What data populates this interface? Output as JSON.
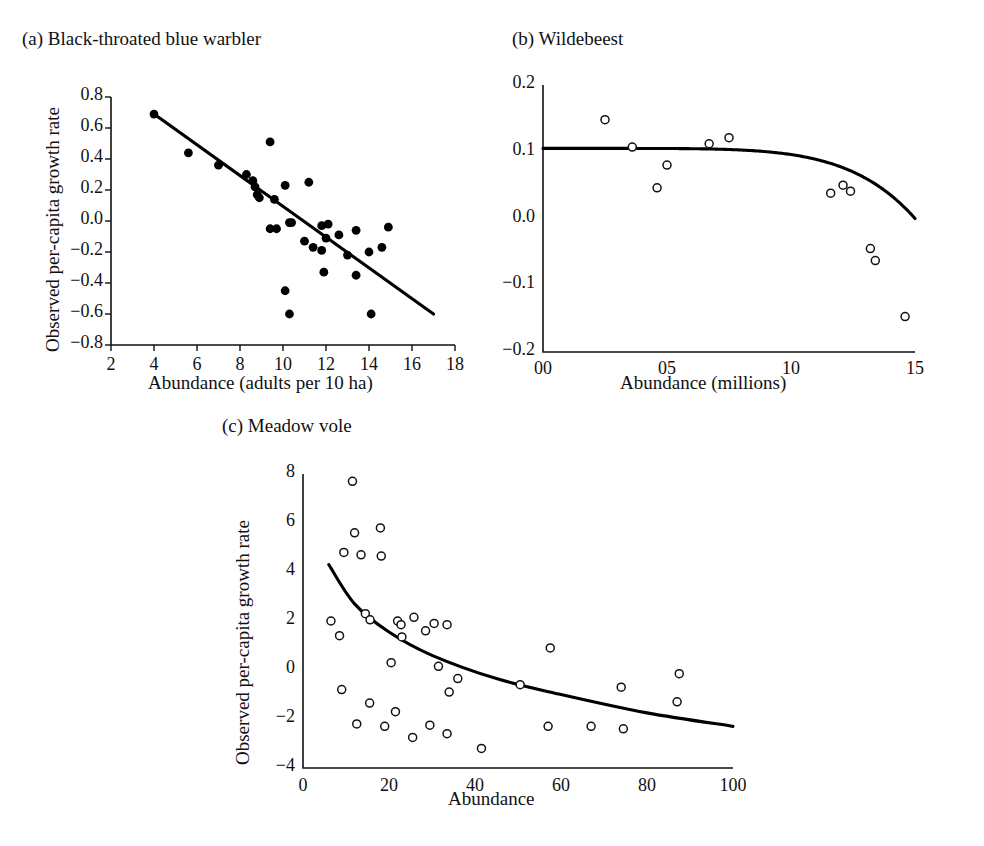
{
  "figure": {
    "background": "#ffffff",
    "ink_color": "#111111"
  },
  "panels": [
    {
      "id": "a",
      "title": "(a) Black-throated blue warbler",
      "marker_style": "filled-circle",
      "fit_type": "linear"
    },
    {
      "id": "b",
      "title": "(b) Wildebeest",
      "marker_style": "open-circle",
      "fit_type": "theta-logistic"
    },
    {
      "id": "c",
      "title": "(c) Meadow vole",
      "marker_style": "open-circle",
      "fit_type": "decaying-curve"
    }
  ],
  "chart_data": [
    {
      "type": "scatter",
      "panel": "a",
      "title": "(a) Black-throated blue warbler",
      "xlabel": "Abundance (adults per 10 ha)",
      "ylabel": "Observed per-capita growth rate",
      "xlim": [
        2,
        18
      ],
      "ylim": [
        -0.8,
        0.8
      ],
      "xticks": [
        2,
        4,
        6,
        8,
        10,
        12,
        14,
        16,
        18
      ],
      "xticklabels": [
        "2",
        "4",
        "6",
        "8",
        "10",
        "12",
        "14",
        "16",
        "18"
      ],
      "yticks": [
        -0.8,
        -0.6,
        -0.4,
        -0.2,
        0.0,
        0.2,
        0.4,
        0.6,
        0.8
      ],
      "yticklabels": [
        "-0.8",
        "-0.6",
        "-0.4",
        "-0.2",
        "0.0",
        "0.2",
        "0.4",
        "0.6",
        "0.8"
      ],
      "grid": false,
      "legend": "none",
      "marker": "filled-circle",
      "points": [
        {
          "x": 4.0,
          "y": 0.69
        },
        {
          "x": 5.6,
          "y": 0.44
        },
        {
          "x": 7.0,
          "y": 0.36
        },
        {
          "x": 8.3,
          "y": 0.3
        },
        {
          "x": 8.6,
          "y": 0.26
        },
        {
          "x": 8.7,
          "y": 0.22
        },
        {
          "x": 8.8,
          "y": 0.17
        },
        {
          "x": 8.9,
          "y": 0.15
        },
        {
          "x": 9.4,
          "y": 0.51
        },
        {
          "x": 9.6,
          "y": 0.14
        },
        {
          "x": 10.1,
          "y": 0.23
        },
        {
          "x": 10.3,
          "y": -0.01
        },
        {
          "x": 10.4,
          "y": -0.01
        },
        {
          "x": 11.2,
          "y": 0.25
        },
        {
          "x": 9.4,
          "y": -0.05
        },
        {
          "x": 9.7,
          "y": -0.05
        },
        {
          "x": 11.8,
          "y": -0.03
        },
        {
          "x": 12.1,
          "y": -0.02
        },
        {
          "x": 12.6,
          "y": -0.09
        },
        {
          "x": 13.4,
          "y": -0.06
        },
        {
          "x": 12.0,
          "y": -0.11
        },
        {
          "x": 11.0,
          "y": -0.13
        },
        {
          "x": 11.4,
          "y": -0.17
        },
        {
          "x": 11.8,
          "y": -0.19
        },
        {
          "x": 13.0,
          "y": -0.22
        },
        {
          "x": 14.0,
          "y": -0.2
        },
        {
          "x": 14.9,
          "y": -0.04
        },
        {
          "x": 14.6,
          "y": -0.17
        },
        {
          "x": 11.9,
          "y": -0.33
        },
        {
          "x": 13.4,
          "y": -0.35
        },
        {
          "x": 10.1,
          "y": -0.45
        },
        {
          "x": 10.3,
          "y": -0.6
        },
        {
          "x": 14.1,
          "y": -0.6
        }
      ],
      "fit": {
        "type": "line",
        "x": [
          4.0,
          17.0
        ],
        "y": [
          0.69,
          -0.6
        ]
      }
    },
    {
      "type": "scatter",
      "panel": "b",
      "title": "(b) Wildebeest",
      "xlabel": "Abundance (millions)",
      "ylabel": "",
      "xlim": [
        0,
        15
      ],
      "ylim": [
        -0.2,
        0.2
      ],
      "xticks": [
        0,
        5,
        10,
        15
      ],
      "xticklabels": [
        "00",
        "05",
        "10",
        "15"
      ],
      "yticks": [
        -0.2,
        -0.1,
        0.0,
        0.1,
        0.2
      ],
      "yticklabels": [
        "-0.2",
        "-0.1",
        "0.0",
        "0.1",
        "0.2"
      ],
      "grid": false,
      "legend": "none",
      "marker": "open-circle",
      "points": [
        {
          "x": 2.5,
          "y": 0.148
        },
        {
          "x": 3.6,
          "y": 0.107
        },
        {
          "x": 4.6,
          "y": 0.046
        },
        {
          "x": 5.0,
          "y": 0.08
        },
        {
          "x": 6.7,
          "y": 0.112
        },
        {
          "x": 7.5,
          "y": 0.121
        },
        {
          "x": 11.6,
          "y": 0.038
        },
        {
          "x": 12.1,
          "y": 0.05
        },
        {
          "x": 12.4,
          "y": 0.041
        },
        {
          "x": 13.2,
          "y": -0.045
        },
        {
          "x": 13.4,
          "y": -0.063
        },
        {
          "x": 14.6,
          "y": -0.147
        }
      ],
      "fit": {
        "type": "theta-logistic",
        "r_max": 0.105,
        "K": 15.0,
        "theta": 6.0,
        "description": "Flat near 0.105 until ~8 million, then steep decline to -0.2 at 15 million"
      }
    },
    {
      "type": "scatter",
      "panel": "c",
      "title": "(c) Meadow vole",
      "xlabel": "Abundance",
      "ylabel": "Observed per-capita growth rate",
      "xlim": [
        0,
        100
      ],
      "ylim": [
        -4,
        8
      ],
      "xticks": [
        0,
        20,
        40,
        60,
        80,
        100
      ],
      "xticklabels": [
        "0",
        "20",
        "40",
        "60",
        "80",
        "100"
      ],
      "yticks": [
        -4,
        -2,
        0,
        2,
        4,
        6,
        8
      ],
      "yticklabels": [
        "-4",
        "-2",
        "0",
        "2",
        "4",
        "6",
        "8"
      ],
      "grid": false,
      "legend": "none",
      "marker": "open-circle",
      "points": [
        {
          "x": 11.5,
          "y": 7.7
        },
        {
          "x": 12.0,
          "y": 5.6
        },
        {
          "x": 18.0,
          "y": 5.8
        },
        {
          "x": 9.5,
          "y": 4.8
        },
        {
          "x": 13.5,
          "y": 4.7
        },
        {
          "x": 18.2,
          "y": 4.65
        },
        {
          "x": 6.5,
          "y": 2.0
        },
        {
          "x": 8.5,
          "y": 1.4
        },
        {
          "x": 14.5,
          "y": 2.3
        },
        {
          "x": 15.6,
          "y": 2.05
        },
        {
          "x": 22.0,
          "y": 2.0
        },
        {
          "x": 22.8,
          "y": 1.85
        },
        {
          "x": 25.8,
          "y": 2.15
        },
        {
          "x": 30.5,
          "y": 1.9
        },
        {
          "x": 33.5,
          "y": 1.85
        },
        {
          "x": 23.0,
          "y": 1.35
        },
        {
          "x": 28.5,
          "y": 1.6
        },
        {
          "x": 57.5,
          "y": 0.9
        },
        {
          "x": 20.5,
          "y": 0.3
        },
        {
          "x": 31.5,
          "y": 0.15
        },
        {
          "x": 36.0,
          "y": -0.35
        },
        {
          "x": 34.0,
          "y": -0.9
        },
        {
          "x": 50.5,
          "y": -0.6
        },
        {
          "x": 74.0,
          "y": -0.7
        },
        {
          "x": 87.5,
          "y": -0.15
        },
        {
          "x": 9.0,
          "y": -0.8
        },
        {
          "x": 15.5,
          "y": -1.35
        },
        {
          "x": 21.5,
          "y": -1.7
        },
        {
          "x": 87.0,
          "y": -1.3
        },
        {
          "x": 12.5,
          "y": -2.2
        },
        {
          "x": 19.0,
          "y": -2.3
        },
        {
          "x": 29.5,
          "y": -2.25
        },
        {
          "x": 25.5,
          "y": -2.75
        },
        {
          "x": 33.5,
          "y": -2.6
        },
        {
          "x": 41.5,
          "y": -3.2
        },
        {
          "x": 57.0,
          "y": -2.3
        },
        {
          "x": 67.0,
          "y": -2.3
        },
        {
          "x": 74.5,
          "y": -2.4
        }
      ],
      "fit": {
        "type": "curve",
        "description": "Concave decaying curve from (6, 4.3) to (100, -2.3)",
        "anchors": [
          {
            "x": 6,
            "y": 4.3
          },
          {
            "x": 12,
            "y": 2.7
          },
          {
            "x": 20,
            "y": 1.55
          },
          {
            "x": 30,
            "y": 0.6
          },
          {
            "x": 45,
            "y": -0.35
          },
          {
            "x": 60,
            "y": -1.0
          },
          {
            "x": 80,
            "y": -1.75
          },
          {
            "x": 100,
            "y": -2.3
          }
        ]
      }
    }
  ]
}
